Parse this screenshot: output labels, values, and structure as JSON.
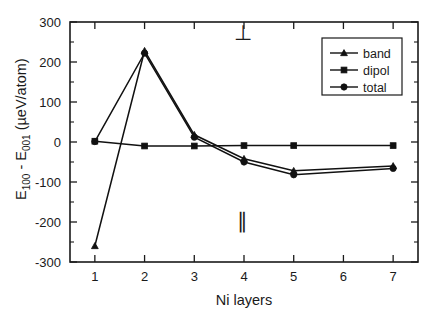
{
  "figure": {
    "background_color": "#ffffff",
    "foreground_color": "#1a1a1a"
  },
  "annotations": {
    "perpendicular_symbol": "⊥",
    "parallel_symbol": "∥"
  },
  "axis_titles": {
    "y_main_1": "E",
    "y_sub_1": "100",
    "y_main_2": " - E",
    "y_sub_2": "001",
    "y_main_3": " (µeV/atom)",
    "x": "Ni layers"
  },
  "legend": {
    "entries": [
      {
        "label": "band",
        "marker": "triangle"
      },
      {
        "label": "dipol",
        "marker": "square"
      },
      {
        "label": "total",
        "marker": "circle"
      }
    ]
  },
  "chart_data": {
    "type": "line",
    "title": "",
    "xlabel": "Ni layers",
    "ylabel": "E_100 - E_001 (µeV/atom)",
    "xlim": [
      0.5,
      7.5
    ],
    "ylim": [
      -300,
      300
    ],
    "xticks": [
      1,
      2,
      3,
      4,
      5,
      6,
      7
    ],
    "xtick_labels": [
      "1",
      "2",
      "3",
      "4",
      "5",
      "6",
      "7"
    ],
    "yticks": [
      -300,
      -200,
      -100,
      0,
      100,
      200,
      300
    ],
    "ytick_labels": [
      "-300",
      "-200",
      "-100",
      "0",
      "100",
      "200",
      "300"
    ],
    "yticks_minor": [
      -250,
      -150,
      -50,
      50,
      150,
      250
    ],
    "grid": false,
    "legend_position": "upper right",
    "x": [
      1,
      2,
      3,
      4,
      5,
      7
    ],
    "series": [
      {
        "name": "band",
        "marker": "triangle",
        "values": [
          -260,
          228,
          18,
          -42,
          -72,
          -60
        ]
      },
      {
        "name": "dipol",
        "marker": "square",
        "values": [
          2,
          -10,
          -10,
          -9,
          -9,
          -9
        ]
      },
      {
        "name": "total",
        "marker": "circle",
        "values": [
          1,
          222,
          12,
          -50,
          -82,
          -66
        ]
      }
    ],
    "annotations": [
      {
        "text": "⊥",
        "x": 3.97,
        "y": 255
      },
      {
        "text": "∥",
        "x": 3.97,
        "y": -215
      }
    ]
  }
}
